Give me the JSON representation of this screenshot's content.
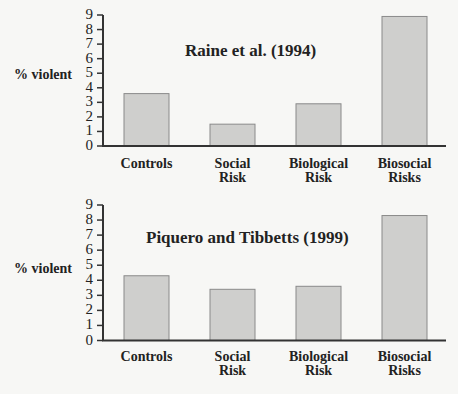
{
  "chart_data": [
    {
      "type": "bar",
      "title": "Raine et al. (1994)",
      "xlabel": "",
      "ylabel": "% violent",
      "ylim": [
        0,
        9
      ],
      "yticks": [
        "0",
        "1",
        "2",
        "3",
        "4",
        "5",
        "6",
        "7",
        "8",
        "9"
      ],
      "categories": [
        "Controls",
        "Social Risk",
        "Biological Risk",
        "Biosocial Risks"
      ],
      "category_lines": [
        [
          "Controls"
        ],
        [
          "Social",
          "Risk"
        ],
        [
          "Biological",
          "Risk"
        ],
        [
          "Biosocial",
          "Risks"
        ]
      ],
      "values": [
        3.6,
        1.5,
        2.9,
        8.9
      ],
      "grid": false,
      "legend": null
    },
    {
      "type": "bar",
      "title": "Piquero and Tibbetts (1999)",
      "xlabel": "",
      "ylabel": "% violent",
      "ylim": [
        0,
        9
      ],
      "yticks": [
        "0",
        "1",
        "2",
        "3",
        "4",
        "5",
        "6",
        "7",
        "8",
        "9"
      ],
      "categories": [
        "Controls",
        "Social Risk",
        "Biological Risk",
        "Biosocial Risks"
      ],
      "category_lines": [
        [
          "Controls"
        ],
        [
          "Social",
          "Risk"
        ],
        [
          "Biological",
          "Risk"
        ],
        [
          "Biosocial",
          "Risks"
        ]
      ],
      "values": [
        4.3,
        3.4,
        3.6,
        8.3
      ],
      "grid": false,
      "legend": null
    }
  ],
  "colors": {
    "bar_fill": "#cfcfcd",
    "bar_stroke": "#8a8a8a",
    "axis": "#333333",
    "background": "#f7f7f5"
  }
}
